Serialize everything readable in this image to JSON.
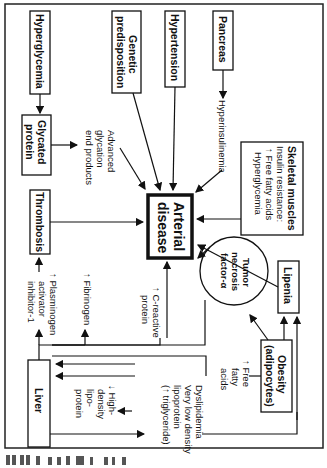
{
  "diagram": {
    "orientation": "rotated-90-clockwise",
    "central_node": {
      "label_line1": "Arterial",
      "label_line2": "disease"
    },
    "nodes": {
      "hyperglycemia": "Hyperglycemia",
      "genetic": {
        "line1": "Genetic",
        "line2": "predisposition"
      },
      "hypertension": "Hypertension",
      "pancreas": "Pancreas",
      "glycated": {
        "line1": "Glycated",
        "line2": "protein"
      },
      "thrombosis": "Thrombosis",
      "skeletal": {
        "title": "Skeletal muscles",
        "line1": "Insulin resistance:",
        "line2": "↑ Free fatty acids",
        "line3": "Hyperglycemia"
      },
      "lipenia": "Lipenia",
      "tnf": {
        "line1": "Tumor",
        "line2": "necrosis",
        "line3": "factor-α"
      },
      "obesity": {
        "line1": "Obesity",
        "line2": "(adipocytes)"
      },
      "liver": "Liver"
    },
    "labels": {
      "hyperinsulinemia": "Hyperinsulinemia",
      "age": {
        "line1": "Advanced",
        "line2": "glycation",
        "line3": "end products"
      },
      "pai": {
        "line1": "↑ Plasminogen",
        "line2": "activator",
        "line3": "inhibitor-1"
      },
      "fibrinogen": "↑ Fibrinogen",
      "crp": {
        "line1": "↑ C-reactive",
        "line2": "protein"
      },
      "ffa": {
        "line1": "↑ Free",
        "line2": "fatty",
        "line3": "acids"
      },
      "dyslipidemia": {
        "line1": "Dyslipidemia",
        "line2": "Very low density",
        "line3": "lipoprotein",
        "line4": "(↑ triglyceride)"
      },
      "hdl": {
        "line1": "↓ High-",
        "line2": "density",
        "line3": "lipo-",
        "line4": "protein"
      }
    },
    "edges": [
      [
        "Hyperglycemia",
        "Glycated protein"
      ],
      [
        "Glycated protein",
        "Advanced glycation end products"
      ],
      [
        "Advanced glycation end products",
        "Arterial disease"
      ],
      [
        "Genetic predisposition",
        "Arterial disease"
      ],
      [
        "Hypertension",
        "Arterial disease"
      ],
      [
        "Pancreas",
        "Hyperinsulinemia"
      ],
      [
        "Hyperinsulinemia",
        "Arterial disease"
      ],
      [
        "Skeletal muscles",
        "Arterial disease"
      ],
      [
        "Thrombosis",
        "Arterial disease"
      ],
      [
        "Lipenia",
        "Arterial disease"
      ],
      [
        "Tumor necrosis factor-α",
        "Arterial disease"
      ],
      [
        "Obesity",
        "Tumor necrosis factor-α"
      ],
      [
        "Obesity",
        "Lipenia"
      ],
      [
        "Obesity",
        "Free fatty acids"
      ],
      [
        "Free fatty acids",
        "Liver"
      ],
      [
        "Liver",
        "Plasminogen activator inhibitor-1"
      ],
      [
        "Plasminogen activator inhibitor-1",
        "Thrombosis"
      ],
      [
        "Liver",
        "Fibrinogen"
      ],
      [
        "Liver",
        "C-reactive protein"
      ],
      [
        "C-reactive protein",
        "Arterial disease"
      ],
      [
        "Tumor necrosis factor-α",
        "Liver"
      ],
      [
        "Liver",
        "Dyslipidemia"
      ],
      [
        "Dyslipidemia",
        "High-density lipoprotein"
      ]
    ],
    "caption_fragment": "cut-off rotated caption"
  }
}
